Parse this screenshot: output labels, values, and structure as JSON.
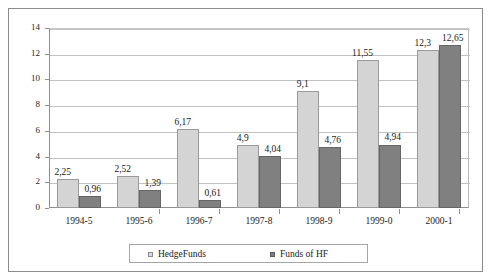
{
  "chart_data": {
    "type": "bar",
    "title": "",
    "subtitle": "",
    "xlabel": "",
    "ylabel": "",
    "ylim": [
      0,
      14
    ],
    "ytick_values": [
      0,
      2,
      4,
      6,
      8,
      10,
      12,
      14
    ],
    "ytick_labels": [
      "0",
      "2",
      "4",
      "6",
      "8",
      "10",
      "12",
      "14"
    ],
    "grid": "horizontal",
    "legend_position": "bottom",
    "decimal_separator": ",",
    "categories": [
      "1994-5",
      "1995-6",
      "1996-7",
      "1997-8",
      "1998-9",
      "1999-0",
      "2000-1"
    ],
    "series": [
      {
        "name": "HedgeFunds",
        "color": "#d4d4d4",
        "values": [
          2.25,
          2.52,
          6.17,
          4.9,
          9.1,
          11.55,
          12.3
        ],
        "labels": [
          "2,25",
          "2,52",
          "6,17",
          "4,9",
          "9,1",
          "11,55",
          "12,3"
        ]
      },
      {
        "name": "Funds of HF",
        "color": "#808080",
        "values": [
          0.96,
          1.39,
          0.61,
          4.04,
          4.76,
          4.94,
          12.65
        ],
        "labels": [
          "0,96",
          "1,39",
          "0,61",
          "4,04",
          "4,76",
          "4,94",
          "12,65"
        ]
      }
    ]
  },
  "legend": {
    "entries": [
      {
        "label": "HedgeFunds",
        "swatch": "light-square-marker"
      },
      {
        "label": "Funds of HF",
        "swatch": "dark-square-marker"
      }
    ]
  }
}
